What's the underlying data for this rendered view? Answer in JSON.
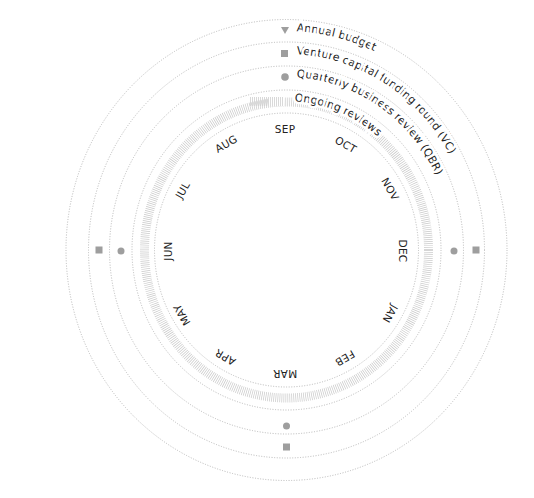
{
  "diagram": {
    "center": {
      "x": 286.5,
      "y": 250
    },
    "colors": {
      "ring": "#b8b8b8",
      "hatch": "#c9c9c9",
      "marker": "#9e9e9e",
      "text": "#222222"
    },
    "legend": [
      {
        "label": "Annual budget",
        "marker": "triangle-down"
      },
      {
        "label": "Venture capital funding round (VC)",
        "marker": "square"
      },
      {
        "label": "Quarterly business review (QBR)",
        "marker": "circle"
      },
      {
        "label": "Ongoing reviews",
        "marker": "hatch"
      }
    ],
    "months": [
      "SEP",
      "OCT",
      "NOV",
      "DEC",
      "JAN",
      "FEB",
      "MAR",
      "APR",
      "MAY",
      "JUN",
      "JUL",
      "AUG"
    ],
    "events": {
      "vc": [
        {
          "position": "DEC"
        },
        {
          "position": "JUN"
        },
        {
          "position": "MAR"
        }
      ],
      "qbr": [
        {
          "position": "DEC"
        },
        {
          "position": "JUN"
        },
        {
          "position": "MAR"
        }
      ],
      "annual_budget": [
        {
          "position": "SEP"
        }
      ]
    }
  }
}
